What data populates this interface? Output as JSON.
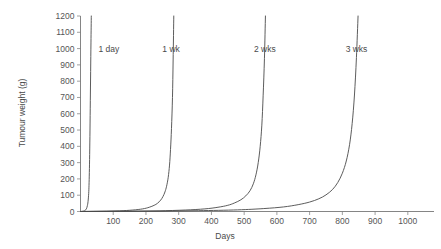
{
  "chart_data": {
    "type": "line",
    "title": "",
    "xlabel": "Days",
    "ylabel": "Tumour weight (g)",
    "xlim": [
      0,
      1080
    ],
    "ylim": [
      0,
      1200
    ],
    "grid": false,
    "legend_position": "inline-annotations",
    "x_ticks": [
      100,
      200,
      300,
      400,
      500,
      600,
      700,
      800,
      900,
      1000
    ],
    "y_ticks": [
      0,
      100,
      200,
      300,
      400,
      500,
      600,
      700,
      800,
      900,
      1000,
      1100,
      1200
    ],
    "annotations": [
      {
        "label": "1 day",
        "x": 55,
        "y": 1000
      },
      {
        "label": "1 wk",
        "x": 250,
        "y": 1000
      },
      {
        "label": "2 wks",
        "x": 530,
        "y": 1000
      },
      {
        "label": "3 wks",
        "x": 810,
        "y": 1000
      }
    ],
    "series": [
      {
        "name": "1 day",
        "x": [
          0,
          5,
          10,
          14,
          18,
          21,
          23,
          25,
          26,
          27,
          28,
          29,
          30,
          31,
          32,
          33
        ],
        "values": [
          0,
          1,
          3,
          7,
          16,
          36,
          60,
          110,
          160,
          240,
          350,
          500,
          680,
          860,
          1040,
          1200
        ]
      },
      {
        "name": "1 wk",
        "x": [
          0,
          40,
          80,
          120,
          160,
          190,
          210,
          225,
          235,
          245,
          252,
          258,
          263,
          268,
          272,
          275,
          278,
          281,
          283,
          285
        ],
        "values": [
          0,
          1,
          2,
          4,
          9,
          16,
          26,
          38,
          50,
          70,
          92,
          120,
          155,
          210,
          285,
          380,
          510,
          700,
          930,
          1200
        ]
      },
      {
        "name": "2 wks",
        "x": [
          0,
          80,
          160,
          240,
          320,
          380,
          420,
          450,
          470,
          490,
          505,
          518,
          528,
          536,
          543,
          549,
          554,
          558,
          562,
          565
        ],
        "values": [
          0,
          1,
          2,
          4,
          9,
          16,
          26,
          38,
          52,
          72,
          96,
          128,
          170,
          225,
          300,
          400,
          530,
          710,
          940,
          1200
        ]
      },
      {
        "name": "3 wks",
        "x": [
          0,
          120,
          240,
          360,
          480,
          560,
          620,
          665,
          700,
          728,
          750,
          770,
          786,
          800,
          812,
          822,
          830,
          837,
          843,
          848
        ],
        "values": [
          0,
          1,
          2,
          5,
          10,
          18,
          28,
          42,
          58,
          78,
          102,
          135,
          178,
          235,
          310,
          410,
          540,
          715,
          945,
          1200
        ]
      }
    ]
  },
  "axes": {
    "y_label": "Tumour weight (g)",
    "x_label": "Days",
    "y_tick_labels": [
      "1200",
      "1100",
      "1000",
      "900",
      "800",
      "700",
      "600",
      "500",
      "400",
      "300",
      "200",
      "100",
      "0"
    ],
    "x_tick_labels": [
      "100",
      "200",
      "300",
      "400",
      "500",
      "600",
      "700",
      "800",
      "900",
      "1000"
    ]
  },
  "colors": {
    "curve": "#4a4a4a",
    "axis": "#777777",
    "text": "#555555",
    "background": "#ffffff"
  }
}
